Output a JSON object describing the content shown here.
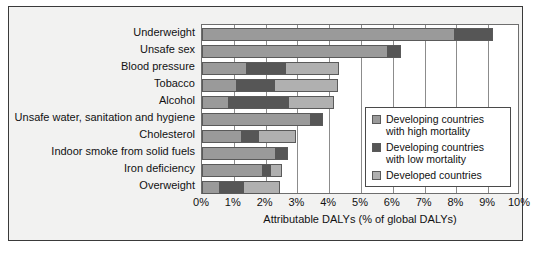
{
  "chart_data": {
    "type": "bar",
    "orientation": "horizontal",
    "stacked": true,
    "title": "",
    "xlabel": "Attributable DALYs (% of global DALYs)",
    "ylabel": "",
    "xlim": [
      0,
      10
    ],
    "xtick_labels": [
      "0%",
      "1%",
      "2%",
      "3%",
      "4%",
      "5%",
      "6%",
      "7%",
      "8%",
      "9%",
      "10%"
    ],
    "xtick_values": [
      0,
      1,
      2,
      3,
      4,
      5,
      6,
      7,
      8,
      9,
      10
    ],
    "grid": "vertical",
    "legend_position": "center-right",
    "categories": [
      "Underweight",
      "Unsafe sex",
      "Blood pressure",
      "Tobacco",
      "Alcohol",
      "Unsafe water, sanitation and hygiene",
      "Cholesterol",
      "Indoor smoke from solid fuels",
      "Iron deficiency",
      "Overweight"
    ],
    "series": [
      {
        "name": "Developing countries with high mortality",
        "color": "#9a9a9a",
        "values": [
          7.9,
          5.8,
          1.35,
          1.05,
          0.8,
          3.35,
          1.2,
          2.25,
          1.85,
          0.5
        ]
      },
      {
        "name": "Developing countries with low mortality",
        "color": "#565656",
        "values": [
          1.2,
          0.4,
          1.25,
          1.2,
          1.9,
          0.4,
          0.55,
          0.4,
          0.3,
          0.8
        ]
      },
      {
        "name": "Developed countries",
        "color": "#b0b0b0",
        "values": [
          0.0,
          0.0,
          1.65,
          1.95,
          1.4,
          0.0,
          1.15,
          0.0,
          0.3,
          1.1
        ]
      }
    ],
    "totals": [
      9.1,
      6.2,
      4.25,
      4.2,
      4.1,
      3.75,
      2.9,
      2.65,
      2.45,
      2.4
    ]
  },
  "legend": {
    "items": [
      {
        "label_line1": "Developing countries",
        "label_line2": "with high mortality",
        "swatch": "#9a9a9a"
      },
      {
        "label_line1": "Developing countries",
        "label_line2": "with low mortality",
        "swatch": "#565656"
      },
      {
        "label_line1": "Developed countries",
        "label_line2": "",
        "swatch": "#b0b0b0"
      }
    ]
  }
}
